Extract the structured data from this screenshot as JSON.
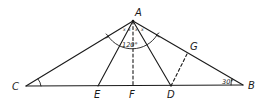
{
  "diagram": {
    "points": {
      "A": {
        "label": "A",
        "x": 133,
        "y": 21
      },
      "B": {
        "label": "B",
        "x": 243,
        "y": 85
      },
      "C": {
        "label": "C",
        "x": 26,
        "y": 86
      },
      "D": {
        "label": "D",
        "x": 171,
        "y": 86
      },
      "E": {
        "label": "E",
        "x": 98,
        "y": 86
      },
      "F": {
        "label": "F",
        "x": 133,
        "y": 86
      },
      "G": {
        "label": "G",
        "x": 187,
        "y": 54
      }
    },
    "segments": [
      {
        "from": "A",
        "to": "C",
        "style": "solid"
      },
      {
        "from": "A",
        "to": "B",
        "style": "solid"
      },
      {
        "from": "C",
        "to": "B",
        "style": "solid"
      },
      {
        "from": "A",
        "to": "E",
        "style": "solid"
      },
      {
        "from": "A",
        "to": "D",
        "style": "solid"
      },
      {
        "from": "A",
        "to": "F",
        "style": "dashed"
      },
      {
        "from": "D",
        "to": "G",
        "style": "dashed"
      }
    ],
    "angle_labels": {
      "A_total": "120°",
      "B": "30°",
      "A_parts": [
        "x",
        "x",
        "x",
        "x"
      ]
    },
    "colors": {
      "stroke": "#1a1a1a",
      "background": "#ffffff"
    }
  }
}
